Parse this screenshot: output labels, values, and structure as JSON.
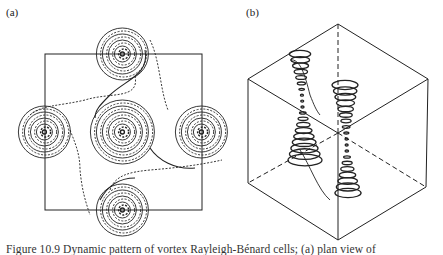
{
  "figure": {
    "panel_a_label": "(a)",
    "panel_b_label": "(b)",
    "caption": "Figure 10.9 Dynamic pattern of vortex Rayleigh-Bénard cells; (a) plan view of",
    "panel_a": {
      "description": "plan view: square cell with five spiral vortices (solid and dashed streamlines)",
      "square": {
        "x": 45,
        "y": 54,
        "w": 157,
        "h": 156
      },
      "vortex_centers": [
        [
          123,
          54
        ],
        [
          45,
          132
        ],
        [
          123,
          132
        ],
        [
          202,
          132
        ],
        [
          123,
          210
        ]
      ]
    },
    "panel_b": {
      "description": "3D cube with two helical vortex tubes",
      "cube_vertices": {
        "top": [
          338,
          24
        ],
        "upper_left": [
          248,
          79
        ],
        "upper_right": [
          428,
          79
        ],
        "center": [
          338,
          133
        ],
        "lower_left": [
          248,
          183
        ],
        "lower_right": [
          426,
          187
        ],
        "bottom": [
          338,
          240
        ]
      }
    }
  }
}
